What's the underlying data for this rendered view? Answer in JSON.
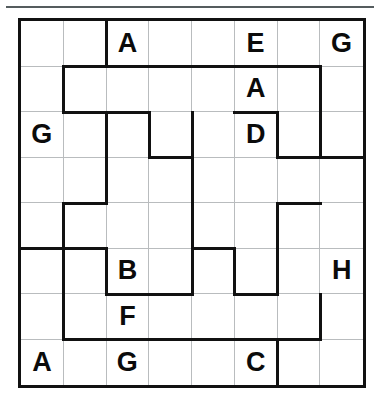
{
  "puzzle": {
    "type": "letter-region-grid",
    "rows": 8,
    "columns": 8,
    "letters_used": [
      "A",
      "B",
      "C",
      "D",
      "E",
      "F",
      "G",
      "H"
    ],
    "colors": {
      "heavy_border": "#111111",
      "light_border": "#b9bcbe",
      "letter": "#0b0b0b",
      "background": "#ffffff",
      "top_rule": "#555c5e"
    },
    "given_letters": [
      {
        "row": 1,
        "col": 3,
        "letter": "A"
      },
      {
        "row": 1,
        "col": 6,
        "letter": "E"
      },
      {
        "row": 1,
        "col": 8,
        "letter": "G"
      },
      {
        "row": 2,
        "col": 6,
        "letter": "A"
      },
      {
        "row": 3,
        "col": 1,
        "letter": "G"
      },
      {
        "row": 3,
        "col": 6,
        "letter": "D"
      },
      {
        "row": 6,
        "col": 3,
        "letter": "B"
      },
      {
        "row": 6,
        "col": 8,
        "letter": "H"
      },
      {
        "row": 7,
        "col": 3,
        "letter": "F"
      },
      {
        "row": 8,
        "col": 1,
        "letter": "A"
      },
      {
        "row": 8,
        "col": 3,
        "letter": "G"
      },
      {
        "row": 8,
        "col": 6,
        "letter": "C"
      }
    ],
    "cells": [
      [
        "",
        "",
        "A",
        "",
        "",
        "E",
        "",
        "G"
      ],
      [
        "",
        "",
        "",
        "",
        "",
        "A",
        "",
        ""
      ],
      [
        "G",
        "",
        "",
        "",
        "",
        "D",
        "",
        ""
      ],
      [
        "",
        "",
        "",
        "",
        "",
        "",
        "",
        ""
      ],
      [
        "",
        "",
        "",
        "",
        "",
        "",
        "",
        ""
      ],
      [
        "",
        "",
        "B",
        "",
        "",
        "",
        "",
        "H"
      ],
      [
        "",
        "",
        "F",
        "",
        "",
        "",
        "",
        ""
      ],
      [
        "A",
        "",
        "G",
        "",
        "",
        "C",
        "",
        ""
      ]
    ],
    "heavy_horizontal_edges": [
      {
        "below_row": 1,
        "from_col": 2,
        "to_col": 7
      },
      {
        "below_row": 2,
        "from_col": 2,
        "to_col": 3
      },
      {
        "below_row": 2,
        "from_col": 6,
        "to_col": 6
      },
      {
        "below_row": 3,
        "from_col": 4,
        "to_col": 4
      },
      {
        "below_row": 3,
        "from_col": 7,
        "to_col": 8
      },
      {
        "below_row": 4,
        "from_col": 2,
        "to_col": 2
      },
      {
        "below_row": 4,
        "from_col": 7,
        "to_col": 7
      },
      {
        "below_row": 5,
        "from_col": 1,
        "to_col": 2
      },
      {
        "below_row": 5,
        "from_col": 5,
        "to_col": 5
      },
      {
        "below_row": 6,
        "from_col": 3,
        "to_col": 4
      },
      {
        "below_row": 6,
        "from_col": 6,
        "to_col": 6
      },
      {
        "below_row": 7,
        "from_col": 2,
        "to_col": 7
      }
    ],
    "heavy_vertical_edges": [
      {
        "right_of_col": 2,
        "from_row": 1,
        "to_row": 1
      },
      {
        "right_of_col": 1,
        "from_row": 2,
        "to_row": 2
      },
      {
        "right_of_col": 7,
        "from_row": 2,
        "to_row": 3
      },
      {
        "right_of_col": 2,
        "from_row": 3,
        "to_row": 4
      },
      {
        "right_of_col": 3,
        "from_row": 3,
        "to_row": 3
      },
      {
        "right_of_col": 4,
        "from_row": 3,
        "to_row": 6
      },
      {
        "right_of_col": 6,
        "from_row": 3,
        "to_row": 3
      },
      {
        "right_of_col": 1,
        "from_row": 5,
        "to_row": 7
      },
      {
        "right_of_col": 6,
        "from_row": 5,
        "to_row": 6
      },
      {
        "right_of_col": 2,
        "from_row": 6,
        "to_row": 6
      },
      {
        "right_of_col": 5,
        "from_row": 6,
        "to_row": 6
      },
      {
        "right_of_col": 7,
        "from_row": 7,
        "to_row": 7
      },
      {
        "right_of_col": 6,
        "from_row": 8,
        "to_row": 8
      }
    ]
  }
}
